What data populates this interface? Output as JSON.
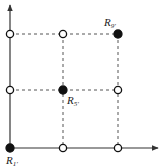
{
  "diagram": {
    "type": "grid-points",
    "axes": {
      "x_arrow": true,
      "y_arrow": true
    },
    "grid": {
      "columns": 3,
      "rows": 3,
      "line_style": "dashed"
    },
    "points": [
      {
        "col": 0,
        "row": 0,
        "filled": true,
        "label": "R",
        "subscript": "1'"
      },
      {
        "col": 1,
        "row": 0,
        "filled": false,
        "label": "",
        "subscript": ""
      },
      {
        "col": 2,
        "row": 0,
        "filled": false,
        "label": "",
        "subscript": ""
      },
      {
        "col": 0,
        "row": 1,
        "filled": false,
        "label": "",
        "subscript": ""
      },
      {
        "col": 1,
        "row": 1,
        "filled": true,
        "label": "R",
        "subscript": "5'"
      },
      {
        "col": 2,
        "row": 1,
        "filled": false,
        "label": "",
        "subscript": ""
      },
      {
        "col": 0,
        "row": 2,
        "filled": false,
        "label": "",
        "subscript": ""
      },
      {
        "col": 1,
        "row": 2,
        "filled": false,
        "label": "",
        "subscript": ""
      },
      {
        "col": 2,
        "row": 2,
        "filled": true,
        "label": "R",
        "subscript": "9'"
      }
    ],
    "labels": {
      "r1": {
        "main": "R",
        "sub": "1'"
      },
      "r5": {
        "main": "R",
        "sub": "5'"
      },
      "r9": {
        "main": "R",
        "sub": "9'"
      }
    },
    "colors": {
      "line": "#444444",
      "point": "#111111",
      "fill_hollow": "#ffffff"
    }
  }
}
